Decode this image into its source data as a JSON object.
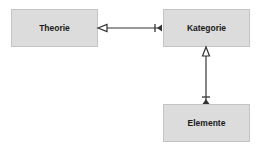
{
  "diagram": {
    "nodes": [
      {
        "id": "theorie",
        "label": "Theorie"
      },
      {
        "id": "kategorie",
        "label": "Kategorie"
      },
      {
        "id": "elemente",
        "label": "Elemente"
      }
    ],
    "edges": [
      {
        "from": "kategorie",
        "to": "theorie",
        "source_end": "bar-arrow",
        "target_end": "open-triangle"
      },
      {
        "from": "elemente",
        "to": "kategorie",
        "source_end": "bar-arrow",
        "target_end": "open-triangle"
      }
    ],
    "colors": {
      "box_fill": "#dcdcdc",
      "box_border": "#c4c4c4",
      "line": "#333333"
    }
  }
}
